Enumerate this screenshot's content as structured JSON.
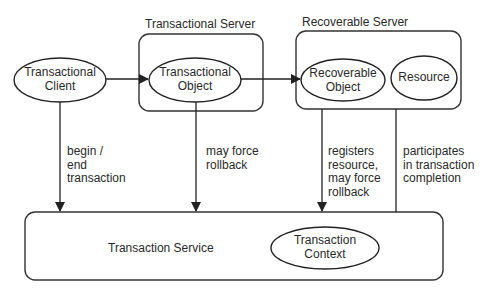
{
  "diagram": {
    "title": "",
    "nodes": {
      "transactional_client": {
        "line1": "Transactional",
        "line2": "Client",
        "shape": "ellipse"
      },
      "transactional_server": {
        "label": "Transactional Server",
        "shape": "rounded-rect"
      },
      "transactional_object": {
        "line1": "Transactional",
        "line2": "Object",
        "shape": "ellipse"
      },
      "recoverable_server": {
        "label": "Recoverable Server",
        "shape": "rounded-rect"
      },
      "recoverable_object": {
        "line1": "Recoverable",
        "line2": "Object",
        "shape": "ellipse"
      },
      "resource": {
        "label": "Resource",
        "shape": "ellipse"
      },
      "transaction_service": {
        "label": "Transaction Service",
        "shape": "rounded-rect"
      },
      "transaction_context": {
        "line1": "Transaction",
        "line2": "Context",
        "shape": "ellipse"
      }
    },
    "edges": {
      "client_to_object": {
        "from": "Transactional Client",
        "to": "Transactional Object",
        "label": ""
      },
      "object_to_recoverable": {
        "from": "Transactional Object",
        "to": "Recoverable Object",
        "label": ""
      },
      "client_to_service": {
        "from": "Transactional Client",
        "to": "Transaction Service",
        "line1": "begin /",
        "line2": "end",
        "line3": "transaction"
      },
      "object_to_service": {
        "from": "Transactional Object",
        "to": "Transaction Service",
        "line1": "may force",
        "line2": "rollback"
      },
      "recoverable_to_service": {
        "from": "Recoverable Object",
        "to": "Transaction Service",
        "line1": "registers",
        "line2": "resource,",
        "line3": "may force",
        "line4": "rollback"
      },
      "resource_to_service": {
        "from": "Resource",
        "to": "Transaction Service",
        "line1": "participates",
        "line2": "in transaction",
        "line3": "completion"
      }
    },
    "colors": {
      "stroke": "#333333",
      "text": "#2a2a2a",
      "background": "#ffffff"
    }
  }
}
